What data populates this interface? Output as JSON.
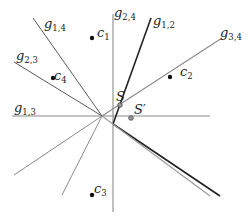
{
  "diagram": {
    "concurrency_point": {
      "x": 102,
      "y": 116
    },
    "lines": [
      {
        "id": "g13",
        "label": "g",
        "sub": "1,3",
        "x1": 12,
        "y1": 116,
        "x2": 210,
        "y2": 116,
        "color": "#8a8a8a",
        "width": 1.1,
        "lx": 14,
        "ly": 112
      },
      {
        "id": "g24",
        "label": "g",
        "sub": "2,4",
        "x1": 113,
        "y1": 14,
        "x2": 113,
        "y2": 212,
        "color": "#8a8a8a",
        "width": 1.1,
        "lx": 114,
        "ly": 17
      },
      {
        "id": "g12",
        "label": "g",
        "sub": "1,2",
        "x1": 151,
        "y1": 18,
        "x2": 113,
        "y2": 124,
        "color": "#222222",
        "width": 1.6,
        "lx": 153,
        "ly": 25
      },
      {
        "id": "g12b",
        "label": "",
        "sub": "",
        "x1": 113,
        "y1": 124,
        "x2": 220,
        "y2": 196,
        "color": "#222222",
        "width": 1.6
      },
      {
        "id": "g34",
        "label": "g",
        "sub": "3,4",
        "x1": 222,
        "y1": 38,
        "x2": 102,
        "y2": 116,
        "color": "#8a8a8a",
        "width": 1.1,
        "lx": 220,
        "ly": 37
      },
      {
        "id": "g23",
        "label": "g",
        "sub": "2,3",
        "x1": 14,
        "y1": 62,
        "x2": 102,
        "y2": 116,
        "color": "#5a5a5a",
        "width": 1.0,
        "lx": 16,
        "ly": 60
      },
      {
        "id": "g14",
        "label": "g",
        "sub": "1,4",
        "x1": 33,
        "y1": 18,
        "x2": 102,
        "y2": 116,
        "color": "#5a5a5a",
        "width": 1.0,
        "lx": 44,
        "ly": 28
      },
      {
        "id": "ext-a",
        "label": "",
        "sub": "",
        "x1": 102,
        "y1": 116,
        "x2": 14,
        "y2": 175,
        "color": "#8a8a8a",
        "width": 1.0
      },
      {
        "id": "ext-b",
        "label": "",
        "sub": "",
        "x1": 102,
        "y1": 116,
        "x2": 62,
        "y2": 195,
        "color": "#8a8a8a",
        "width": 1.0
      },
      {
        "id": "ext-c",
        "label": "",
        "sub": "",
        "x1": 102,
        "y1": 116,
        "x2": 210,
        "y2": 196,
        "color": "#9a9a9a",
        "width": 1.1
      }
    ],
    "points": [
      {
        "id": "c1",
        "label": "c",
        "sub": "1",
        "x": 92,
        "y": 38,
        "lx": 97,
        "ly": 37
      },
      {
        "id": "c2",
        "label": "c",
        "sub": "2",
        "x": 170,
        "y": 77,
        "lx": 180,
        "ly": 76
      },
      {
        "id": "c3",
        "label": "c",
        "sub": "3",
        "x": 92,
        "y": 195,
        "lx": 94,
        "ly": 193
      },
      {
        "id": "c4",
        "label": "c",
        "sub": "4",
        "x": 53,
        "y": 78,
        "lx": 54,
        "ly": 80
      }
    ],
    "markers": [
      {
        "id": "S",
        "label": "S",
        "prime": "",
        "x": 120,
        "y": 105,
        "lx": 116,
        "ly": 101
      },
      {
        "id": "Sprime",
        "label": "S",
        "prime": "′",
        "x": 131,
        "y": 118,
        "lx": 134,
        "ly": 114
      }
    ]
  }
}
